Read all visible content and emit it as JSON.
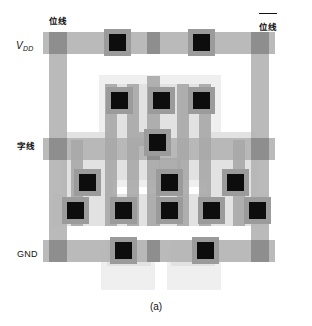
{
  "figure": {
    "caption": "(a)",
    "type": "ic-layout"
  },
  "labels": {
    "vdd": "V",
    "vdd_sub": "DD",
    "word_line": "字线",
    "gnd": "GND",
    "bit_line": "位线",
    "bit_line_bar": "位线"
  },
  "colors": {
    "background": "#ffffff",
    "well": "#efefef",
    "diffusion": "#e2e2e2",
    "diffusion_alt": "#d8d8d8",
    "poly": "#a8a8a8",
    "poly_dark": "#9a9a9a",
    "metal": "#b4b4b4",
    "metal_dark": "#8e8e8e",
    "contact_pad": "#9b9b9b",
    "contact": "#0d0d0d",
    "text": "#111111"
  },
  "layout_shapes": {
    "wells": [
      {
        "name": "upper-well",
        "x": 56,
        "y": 47,
        "w": 122,
        "h": 112
      },
      {
        "name": "lower-left-well",
        "x": 58,
        "y": 218,
        "w": 54,
        "h": 44
      },
      {
        "name": "lower-right-well",
        "x": 124,
        "y": 218,
        "w": 54,
        "h": 44
      }
    ],
    "diffusions": [
      {
        "name": "core-diffusion",
        "x": 66,
        "y": 56,
        "w": 102,
        "h": 96
      },
      {
        "name": "mid-left-diffusion",
        "x": 20,
        "y": 104,
        "w": 50,
        "h": 86
      },
      {
        "name": "mid-right-diffusion",
        "x": 164,
        "y": 104,
        "w": 50,
        "h": 86
      },
      {
        "name": "bottom-strip-diffusion",
        "x": 10,
        "y": 166,
        "w": 214,
        "h": 32
      },
      {
        "name": "gnd-left-tab",
        "x": 64,
        "y": 212,
        "w": 44,
        "h": 26
      },
      {
        "name": "gnd-right-tab",
        "x": 128,
        "y": 212,
        "w": 44,
        "h": 26
      }
    ],
    "poly_strips": [
      {
        "name": "poly-col-1",
        "x": 28,
        "y": 112,
        "w": 12,
        "h": 86
      },
      {
        "name": "poly-col-2",
        "x": 62,
        "y": 56,
        "w": 12,
        "h": 142
      },
      {
        "name": "poly-col-3",
        "x": 84,
        "y": 56,
        "w": 12,
        "h": 142
      },
      {
        "name": "poly-col-4",
        "x": 104,
        "y": 48,
        "w": 13,
        "h": 150
      },
      {
        "name": "poly-col-5",
        "x": 134,
        "y": 56,
        "w": 12,
        "h": 142
      },
      {
        "name": "poly-col-6",
        "x": 156,
        "y": 56,
        "w": 12,
        "h": 142
      },
      {
        "name": "poly-col-7",
        "x": 190,
        "y": 112,
        "w": 12,
        "h": 86
      },
      {
        "name": "poly-hook-left",
        "x": 96,
        "y": 104,
        "w": 20,
        "h": 14
      },
      {
        "name": "poly-hook-right",
        "x": 116,
        "y": 130,
        "w": 22,
        "h": 14
      }
    ],
    "metal_rails": [
      {
        "name": "vdd-rail",
        "x": 0,
        "y": 4,
        "w": 232,
        "h": 22
      },
      {
        "name": "word-line-rail",
        "x": 0,
        "y": 110,
        "w": 232,
        "h": 22
      },
      {
        "name": "gnd-rail",
        "x": 0,
        "y": 212,
        "w": 232,
        "h": 22
      },
      {
        "name": "bit-line-left",
        "x": 6,
        "y": 4,
        "w": 18,
        "h": 230
      },
      {
        "name": "bit-line-right",
        "x": 208,
        "y": 4,
        "w": 18,
        "h": 230
      }
    ],
    "contacts": [
      {
        "name": "vdd-contact-left",
        "x": 66,
        "y": 6,
        "size": 17
      },
      {
        "name": "vdd-contact-right",
        "x": 150,
        "y": 6,
        "size": 17
      },
      {
        "name": "p-contact-left",
        "x": 68,
        "y": 64,
        "size": 17
      },
      {
        "name": "p-contact-mid",
        "x": 110,
        "y": 64,
        "size": 17
      },
      {
        "name": "p-contact-right",
        "x": 150,
        "y": 64,
        "size": 17
      },
      {
        "name": "cross-couple-node",
        "x": 106,
        "y": 106,
        "size": 17
      },
      {
        "name": "n-contact-left",
        "x": 36,
        "y": 146,
        "size": 17
      },
      {
        "name": "n-contact-mid",
        "x": 118,
        "y": 146,
        "size": 17
      },
      {
        "name": "n-contact-right",
        "x": 184,
        "y": 146,
        "size": 17
      },
      {
        "name": "row-contact-1",
        "x": 24,
        "y": 174,
        "size": 17
      },
      {
        "name": "row-contact-2",
        "x": 72,
        "y": 174,
        "size": 17
      },
      {
        "name": "row-contact-3",
        "x": 118,
        "y": 174,
        "size": 17
      },
      {
        "name": "row-contact-4",
        "x": 160,
        "y": 174,
        "size": 17
      },
      {
        "name": "row-contact-5",
        "x": 206,
        "y": 174,
        "size": 17
      },
      {
        "name": "gnd-contact-left",
        "x": 72,
        "y": 214,
        "size": 17
      },
      {
        "name": "gnd-contact-right",
        "x": 154,
        "y": 214,
        "size": 17
      }
    ]
  }
}
